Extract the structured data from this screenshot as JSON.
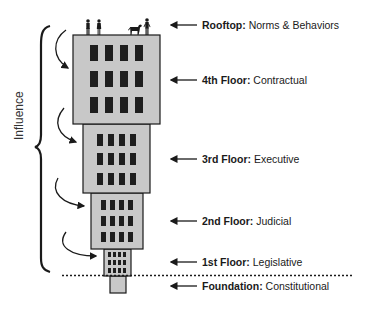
{
  "diagram": {
    "side_label": "Influence",
    "colors": {
      "floor_fill": "#c8c8c8",
      "outline": "#1a1a1a",
      "window": "#1e1e1e",
      "text": "#1a1a1a"
    },
    "levels": [
      {
        "name": "Rooftop:",
        "desc": "Norms & Behaviors"
      },
      {
        "name": "4th Floor:",
        "desc": "Contractual"
      },
      {
        "name": "3rd Floor:",
        "desc": "Executive"
      },
      {
        "name": "2nd Floor:",
        "desc": "Judicial"
      },
      {
        "name": "1st Floor:",
        "desc": "Legislative"
      },
      {
        "name": "Foundation:",
        "desc": "Constitutional"
      }
    ],
    "rooftop_figures": [
      "person",
      "person",
      "dog",
      "person"
    ]
  }
}
